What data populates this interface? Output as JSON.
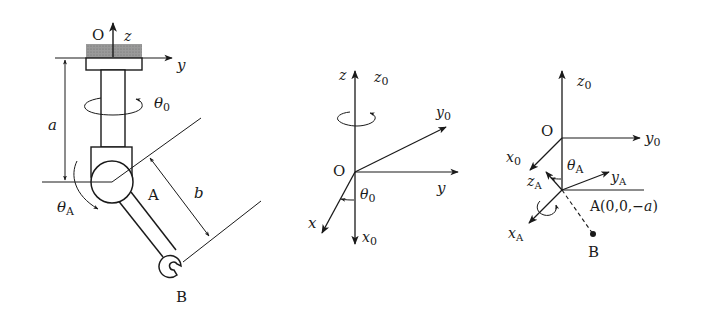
{
  "figure_left": {
    "title": "robot arm",
    "labels": {
      "origin": "O",
      "z_axis": "z",
      "y_axis": "y",
      "theta0": "θ",
      "theta0_sub": "0",
      "dim_a": "a",
      "dim_b": "b",
      "joint_A": "A",
      "thetaA": "θ",
      "thetaA_sub": "A",
      "end_B": "B"
    }
  },
  "figure_middle": {
    "title": "base frame rotation",
    "labels": {
      "z": "z",
      "z0": "z",
      "z0_sub": "0",
      "y0": "y",
      "y0_sub": "0",
      "origin": "O",
      "y": "y",
      "theta0": "θ",
      "theta0_sub": "0",
      "x": "x",
      "x0": "x",
      "x0_sub": "0"
    }
  },
  "figure_right": {
    "title": "joint A frame",
    "labels": {
      "z0": "z",
      "z0_sub": "0",
      "origin": "O",
      "y0": "y",
      "y0_sub": "0",
      "x0": "x",
      "x0_sub": "0",
      "thetaA": "θ",
      "thetaA_sub": "A",
      "zA": "z",
      "zA_sub": "A",
      "yA": "y",
      "yA_sub": "A",
      "pointA": "A(0,0,−",
      "pointA_a": "a",
      "pointA_close": ")",
      "xA": "x",
      "xA_sub": "A",
      "pointB": "B"
    }
  }
}
